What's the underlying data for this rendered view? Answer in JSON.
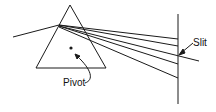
{
  "diagram": {
    "labels": {
      "slit": "Slit",
      "pivot": "Pivot"
    },
    "colors": {
      "stroke": "#1a1a1a",
      "background": "#ffffff"
    }
  }
}
